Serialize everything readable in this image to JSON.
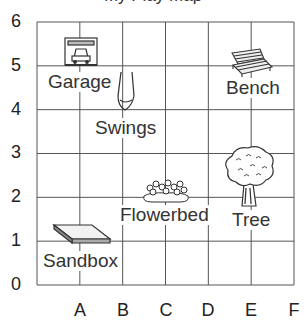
{
  "title_fragment": "My Play Map",
  "grid": {
    "columns": 6,
    "rows": 6,
    "line_color": "#555555"
  },
  "y_axis": {
    "labels": [
      "0",
      "1",
      "2",
      "3",
      "4",
      "5",
      "6"
    ]
  },
  "x_axis": {
    "labels": [
      "A",
      "B",
      "C",
      "D",
      "E",
      "F"
    ]
  },
  "places": [
    {
      "name": "Garage",
      "icon": "garage-icon"
    },
    {
      "name": "Swings",
      "icon": "swings-icon"
    },
    {
      "name": "Bench",
      "icon": "bench-icon"
    },
    {
      "name": "Flowerbed",
      "icon": "flowerbed-icon"
    },
    {
      "name": "Tree",
      "icon": "tree-icon"
    },
    {
      "name": "Sandbox",
      "icon": "sandbox-icon"
    }
  ]
}
